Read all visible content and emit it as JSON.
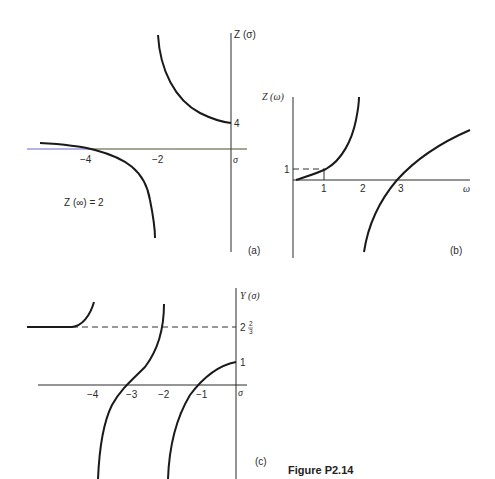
{
  "figure": {
    "caption": "Figure P2.14",
    "panel_a": {
      "tag": "(a)",
      "y_label": "Z (σ)",
      "x_label": "σ",
      "x_ticks": [
        "−4",
        "−2"
      ],
      "y_ticks": [
        "4"
      ],
      "annotation": "Z (∞) = 2",
      "colors": {
        "curve": "#1a1a1a",
        "axis": "#2b2b2b",
        "axis_left_segment": "#6a6ad0"
      }
    },
    "panel_b": {
      "tag": "(b)",
      "y_label": "Z (ω)",
      "x_label": "ω",
      "x_ticks": [
        "1",
        "2",
        "3"
      ],
      "y_ticks": [
        "1"
      ]
    },
    "panel_c": {
      "tag": "(c)",
      "y_label": "Y (σ)",
      "x_label": "σ",
      "x_ticks": [
        "−4",
        "−3",
        "−2",
        "−1"
      ],
      "y_ticks": [
        "1"
      ],
      "y_tick_fraction": {
        "whole": "2",
        "num": "2",
        "den": "3"
      }
    }
  }
}
